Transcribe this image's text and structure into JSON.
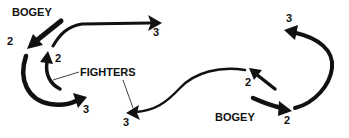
{
  "diagram": {
    "type": "air-combat-maneuver",
    "colors": {
      "ink": "#111111",
      "background": "#ffffff"
    },
    "left_scenario": {
      "bogey_label": "BOGEY",
      "bogey_position_2": "2",
      "bogey_position_3": "3",
      "fighter_position_2": "2",
      "fighter_position_3": "3"
    },
    "center": {
      "fighters_label": "FIGHTERS"
    },
    "right_scenario": {
      "bogey_label": "BOGEY",
      "bogey_position_2": "2",
      "bogey_position_3": "3",
      "fighter_position_2": "2",
      "fighter_position_3": "3"
    }
  }
}
